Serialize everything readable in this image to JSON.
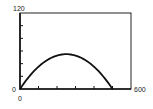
{
  "chart_data": {
    "type": "line",
    "title": "",
    "xlabel": "",
    "ylabel": "",
    "xlim": [
      0,
      600
    ],
    "ylim": [
      0,
      120
    ],
    "x_tick_labels": [
      "0",
      "600"
    ],
    "y_tick_labels": [
      "0",
      "120"
    ],
    "x_tick_count": 6,
    "y_tick_count": 6,
    "grid": false,
    "legend": null,
    "series": [
      {
        "name": "curve",
        "x": [
          0,
          50,
          100,
          150,
          200,
          250,
          300,
          350,
          400,
          450,
          500
        ],
        "y": [
          0,
          19.8,
          35.2,
          46.2,
          52.8,
          55,
          52.8,
          46.2,
          35.2,
          19.8,
          0
        ]
      }
    ]
  },
  "labels": {
    "y_max": "120",
    "y_min": "0",
    "x_min": "0",
    "x_max": "600"
  }
}
